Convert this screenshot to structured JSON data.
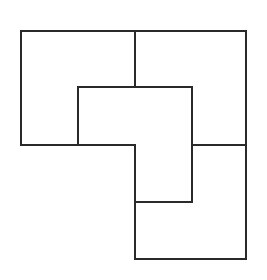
{
  "figure": {
    "caption": "",
    "background_color": "#ffffff",
    "stroke_color": "#2a2a2a",
    "stroke_width": 2,
    "canvas": {
      "width": 267,
      "height": 280
    },
    "grid": {
      "x_positions": [
        21,
        78,
        135,
        192,
        246
      ],
      "y_positions": [
        31,
        87,
        145,
        202,
        259
      ],
      "unit_x": 57,
      "unit_y": 57
    },
    "tiles": [
      {
        "name": "tile-upper-left",
        "label": "",
        "orientation": "0deg",
        "points": "21,31 135,31 135,87 78,87 78,145 21,145"
      },
      {
        "name": "tile-upper-right",
        "label": "",
        "orientation": "90deg",
        "points": "135,31 246,31 246,145 192,145 192,87 135,87"
      },
      {
        "name": "tile-center",
        "label": "",
        "orientation": "180deg",
        "points": "78,87 192,87 192,202 135,202 135,145 78,145"
      },
      {
        "name": "tile-lower-right",
        "label": "",
        "orientation": "270deg",
        "points": "192,145 246,145 246,259 135,259 135,202 192,202"
      }
    ],
    "segments": [
      {
        "name": "outer-top-edge",
        "x1": 21,
        "y1": 31,
        "x2": 246,
        "y2": 31
      },
      {
        "name": "outer-left-edge",
        "x1": 21,
        "y1": 31,
        "x2": 21,
        "y2": 145
      },
      {
        "name": "outer-left-bottom-edge",
        "x1": 21,
        "y1": 145,
        "x2": 135,
        "y2": 145
      },
      {
        "name": "outer-right-edge",
        "x1": 246,
        "y1": 31,
        "x2": 246,
        "y2": 259
      },
      {
        "name": "outer-bottom-edge",
        "x1": 135,
        "y1": 259,
        "x2": 246,
        "y2": 259
      },
      {
        "name": "outer-lower-left-edge",
        "x1": 135,
        "y1": 145,
        "x2": 135,
        "y2": 259
      },
      {
        "name": "inner-top-divider",
        "x1": 135,
        "y1": 31,
        "x2": 135,
        "y2": 87
      },
      {
        "name": "inner-horizontal-upper",
        "x1": 78,
        "y1": 87,
        "x2": 192,
        "y2": 87
      },
      {
        "name": "inner-vertical-left",
        "x1": 78,
        "y1": 87,
        "x2": 78,
        "y2": 145
      },
      {
        "name": "inner-vertical-right",
        "x1": 192,
        "y1": 87,
        "x2": 192,
        "y2": 202
      },
      {
        "name": "inner-horizontal-right",
        "x1": 192,
        "y1": 145,
        "x2": 246,
        "y2": 145
      },
      {
        "name": "inner-horizontal-lower",
        "x1": 135,
        "y1": 202,
        "x2": 192,
        "y2": 202
      }
    ]
  }
}
